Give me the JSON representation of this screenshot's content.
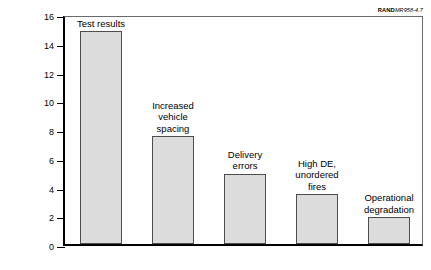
{
  "credit": {
    "publisher": "RAND",
    "report": "MR958-4.7"
  },
  "chart_data": {
    "type": "bar",
    "title": "",
    "xlabel": "",
    "ylabel": "Armored vehicle kills per sortie",
    "ylabel_superscript": "a",
    "ylim": [
      0,
      16
    ],
    "yticks": [
      "0",
      "2",
      "4",
      "6",
      "8",
      "10",
      "12",
      "14",
      "16"
    ],
    "grid": false,
    "legend": "none",
    "categories": [
      "Test results",
      "Increased vehicle spacing",
      "Delivery errors",
      "High DE, unordered fires",
      "Operational degradation"
    ],
    "category_lines": [
      [
        "Test results"
      ],
      [
        "Increased",
        "vehicle",
        "spacing"
      ],
      [
        "Delivery",
        "errors"
      ],
      [
        "High DE,",
        "unordered",
        "fires"
      ],
      [
        "Operational",
        "degradation"
      ]
    ],
    "values": [
      14.8,
      7.5,
      4.9,
      3.45,
      1.85
    ],
    "bar_fill_color": "#dcdcdc",
    "bar_edge_color": "#4d4d4d",
    "axis_color": "#000000"
  }
}
